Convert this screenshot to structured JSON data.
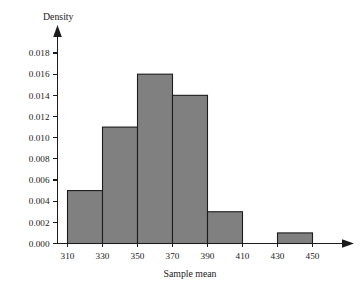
{
  "chart_data": {
    "type": "bar",
    "title": "",
    "subtitle": "",
    "xlabel": "Sample mean",
    "ylabel": "Density",
    "orientation": "vertical",
    "grid": false,
    "legend": null,
    "legend_position": "none",
    "bar_style": {
      "fill_color": "#808080",
      "edge_color": "#1c1c1c",
      "gap": 0
    },
    "axis_style": {
      "color": "#1c1c1c",
      "x_axis_arrow": true,
      "y_axis_arrow": true,
      "tick_direction": "out"
    },
    "xlim": [
      300,
      465
    ],
    "ylim": [
      0.0,
      0.0195
    ],
    "x_tick_labels": [
      "310",
      "330",
      "350",
      "370",
      "390",
      "410",
      "430",
      "450"
    ],
    "x_tick_values": [
      310,
      330,
      350,
      370,
      390,
      410,
      430,
      450
    ],
    "y_tick_labels": [
      "0.000",
      "0.002",
      "0.004",
      "0.006",
      "0.008",
      "0.010",
      "0.012",
      "0.014",
      "0.016",
      "0.018"
    ],
    "y_tick_values": [
      0.0,
      0.002,
      0.004,
      0.006,
      0.008,
      0.01,
      0.012,
      0.014,
      0.016,
      0.018
    ],
    "bin_edges": [
      310,
      330,
      350,
      370,
      390,
      410,
      430,
      450
    ],
    "bins": [
      {
        "left": 310,
        "right": 330,
        "density": 0.005
      },
      {
        "left": 330,
        "right": 350,
        "density": 0.011
      },
      {
        "left": 350,
        "right": 370,
        "density": 0.016
      },
      {
        "left": 370,
        "right": 390,
        "density": 0.014
      },
      {
        "left": 390,
        "right": 410,
        "density": 0.003
      },
      {
        "left": 410,
        "right": 430,
        "density": 0.0
      },
      {
        "left": 430,
        "right": 450,
        "density": 0.001
      }
    ],
    "categories": [
      "310-330",
      "330-350",
      "350-370",
      "370-390",
      "390-410",
      "410-430",
      "430-450"
    ],
    "values": [
      0.005,
      0.011,
      0.016,
      0.014,
      0.003,
      0.0,
      0.001
    ]
  }
}
